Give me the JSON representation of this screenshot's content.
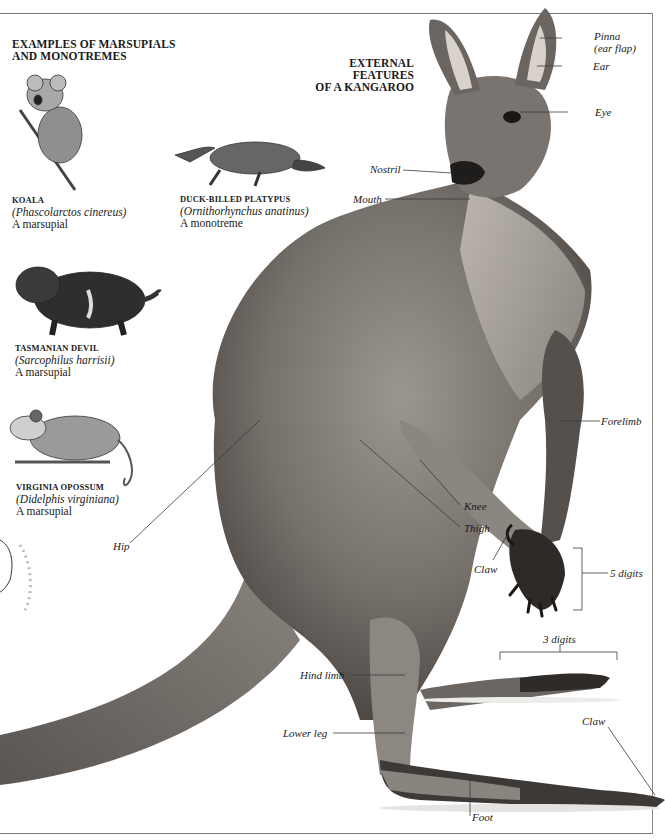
{
  "left_section": {
    "heading_line1": "EXAMPLES OF MARSUPIALS",
    "heading_line2": "AND MONOTREMES",
    "animals": [
      {
        "common_name": "KOALA",
        "scientific_name": "(Phascolarctos cinereus)",
        "type": "A marsupial",
        "illustration": "koala-illustration"
      },
      {
        "common_name": "DUCK-BILLED PLATYPUS",
        "scientific_name": "(Ornithorhynchus anatinus)",
        "type": "A monotreme",
        "illustration": "platypus-illustration"
      },
      {
        "common_name": "TASMANIAN DEVIL",
        "scientific_name": "(Sarcophilus harrisii)",
        "type": "A marsupial",
        "illustration": "tasmanian-devil-illustration"
      },
      {
        "common_name": "VIRGINIA OPOSSUM",
        "scientific_name": "(Didelphis virginiana)",
        "type": "A marsupial",
        "illustration": "opossum-illustration"
      }
    ]
  },
  "main_figure": {
    "heading_line1": "EXTERNAL FEATURES",
    "heading_line2": "OF A KANGAROO",
    "subject": "kangaroo-photo",
    "labels": {
      "pinna_line1": "Pinna",
      "pinna_line2": "(ear flap)",
      "ear": "Ear",
      "eye": "Eye",
      "nostril": "Nostril",
      "mouth": "Mouth",
      "forelimb": "Forelimb",
      "knee": "Knee",
      "thigh": "Thigh",
      "hip": "Hip",
      "claw_fore": "Claw",
      "five_digits": "5 digits",
      "three_digits": "3 digits",
      "hind_limb": "Hind limb",
      "lower_leg": "Lower leg",
      "claw_hind": "Claw",
      "foot": "Foot"
    }
  },
  "colors": {
    "text": "#1a1a1a",
    "rule": "#777777",
    "fur_dark": "#4a4643",
    "fur_mid": "#7d7874",
    "fur_light": "#b9b3ad"
  }
}
